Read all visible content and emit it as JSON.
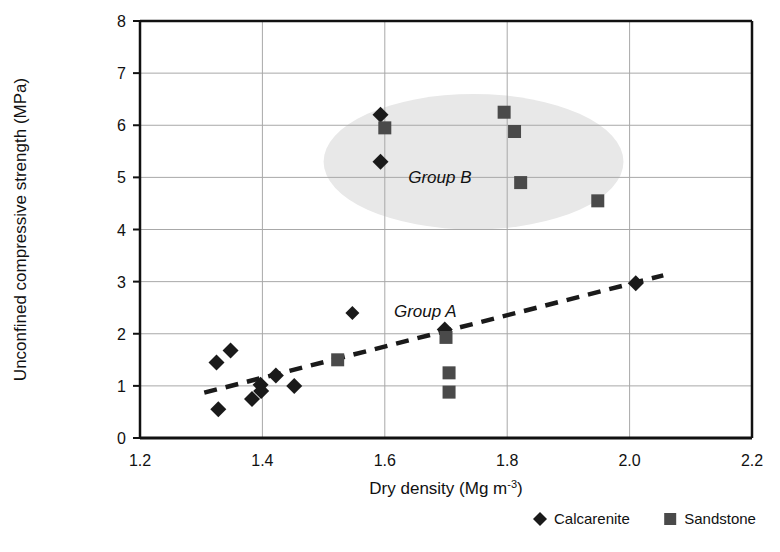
{
  "chart_data": {
    "type": "scatter",
    "title": "",
    "xlabel": "Dry density (Mg m-3)",
    "xlabel_base": "Dry density (Mg m",
    "xlabel_sup": "-3",
    "xlabel_tail": ")",
    "ylabel": "Unconfined compressive strength (MPa)",
    "xlim": [
      1.2,
      2.2
    ],
    "ylim": [
      0,
      8
    ],
    "xticks": [
      "1.2",
      "1.4",
      "1.6",
      "1.8",
      "2.0",
      "2.2"
    ],
    "xtick_values": [
      1.2,
      1.4,
      1.6,
      1.8,
      2.0,
      2.2
    ],
    "yticks": [
      "0",
      "1",
      "2",
      "3",
      "4",
      "5",
      "6",
      "7",
      "8"
    ],
    "ytick_values": [
      0,
      1,
      2,
      3,
      4,
      5,
      6,
      7,
      8
    ],
    "grid": true,
    "grid_color": "#a8a8a8",
    "axis_color": "#111111",
    "legend_position": "bottom-right",
    "series": [
      {
        "name": "Calcarenite",
        "marker": "diamond",
        "color": "#1a1a1a",
        "points": [
          {
            "x": 1.325,
            "y": 1.45
          },
          {
            "x": 1.328,
            "y": 0.55
          },
          {
            "x": 1.348,
            "y": 1.68
          },
          {
            "x": 1.383,
            "y": 0.75
          },
          {
            "x": 1.397,
            "y": 1.02
          },
          {
            "x": 1.398,
            "y": 0.9
          },
          {
            "x": 1.422,
            "y": 1.2
          },
          {
            "x": 1.452,
            "y": 1.0
          },
          {
            "x": 1.593,
            "y": 6.2
          },
          {
            "x": 1.593,
            "y": 5.3
          },
          {
            "x": 1.698,
            "y": 2.08
          },
          {
            "x": 2.01,
            "y": 2.97
          }
        ]
      },
      {
        "name": "Sandstone",
        "marker": "square",
        "color": "#4a4a4a",
        "points": [
          {
            "x": 1.523,
            "y": 1.5
          },
          {
            "x": 1.6,
            "y": 5.95
          },
          {
            "x": 1.7,
            "y": 1.93
          },
          {
            "x": 1.705,
            "y": 1.25
          },
          {
            "x": 1.705,
            "y": 0.88
          },
          {
            "x": 1.795,
            "y": 6.25
          },
          {
            "x": 1.812,
            "y": 5.88
          },
          {
            "x": 1.822,
            "y": 4.9
          },
          {
            "x": 1.948,
            "y": 4.55
          }
        ]
      }
    ],
    "trendline": {
      "style": "dashed",
      "color": "#1a1a1a",
      "x0": 1.305,
      "y0": 0.87,
      "x1": 2.055,
      "y1": 3.12
    },
    "annotations": [
      {
        "name": "group-b-ellipse",
        "type": "ellipse",
        "label": "Group B",
        "label_x": 1.69,
        "label_y": 4.9,
        "cx": 1.745,
        "cy": 5.3,
        "rx": 0.245,
        "ry": 1.3,
        "fill": "#e8e8e8"
      },
      {
        "name": "group-a-label",
        "type": "text",
        "label": "Group A",
        "label_x": 1.615,
        "label_y": 2.42,
        "marker": "diamond",
        "marker_x": 1.547,
        "marker_y": 2.4
      }
    ]
  },
  "legend": {
    "entries": [
      {
        "label": "Calcarenite",
        "marker": "diamond",
        "color": "#1a1a1a"
      },
      {
        "label": "Sandstone",
        "marker": "square",
        "color": "#4a4a4a"
      }
    ]
  }
}
